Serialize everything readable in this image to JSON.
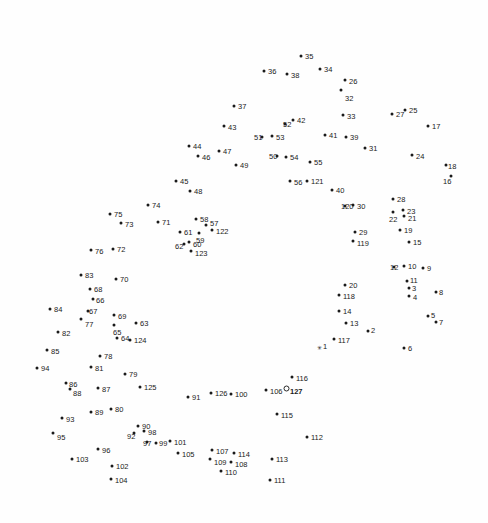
{
  "page": {
    "type": "connect-the-dots",
    "width": 488,
    "height": 523,
    "background_color": "#fefefe",
    "dot_color": "#1a1a1a",
    "label_color": "#1a1a1a",
    "total_dots": 127,
    "start_label": "127",
    "start_marker": "open-circle",
    "first_point_marker": "asterisk"
  },
  "dots": [
    {
      "n": "1",
      "x": 319,
      "y": 347,
      "lx": 323,
      "ly": 343,
      "marker": "star"
    },
    {
      "n": "2",
      "x": 368,
      "y": 331,
      "lx": 371,
      "ly": 327,
      "marker": "dot"
    },
    {
      "n": "3",
      "x": 409,
      "y": 288,
      "lx": 412,
      "ly": 285,
      "marker": "dot"
    },
    {
      "n": "4",
      "x": 409,
      "y": 296,
      "lx": 413,
      "ly": 294,
      "marker": "dot"
    },
    {
      "n": "5",
      "x": 428,
      "y": 316,
      "lx": 431,
      "ly": 312,
      "marker": "dot"
    },
    {
      "n": "6",
      "x": 404,
      "y": 348,
      "lx": 408,
      "ly": 345,
      "marker": "dot"
    },
    {
      "n": "7",
      "x": 436,
      "y": 322,
      "lx": 439,
      "ly": 319,
      "marker": "dot"
    },
    {
      "n": "8",
      "x": 436,
      "y": 292,
      "lx": 439,
      "ly": 289,
      "marker": "dot"
    },
    {
      "n": "9",
      "x": 423,
      "y": 268,
      "lx": 427,
      "ly": 265,
      "marker": "dot"
    },
    {
      "n": "10",
      "x": 404,
      "y": 266,
      "lx": 408,
      "ly": 263,
      "marker": "dot"
    },
    {
      "n": "11",
      "x": 407,
      "y": 281,
      "lx": 410,
      "ly": 277,
      "marker": "dot"
    },
    {
      "n": "12",
      "x": 394,
      "y": 267,
      "lx": 390,
      "ly": 264,
      "marker": "dot"
    },
    {
      "n": "13",
      "x": 346,
      "y": 323,
      "lx": 350,
      "ly": 320,
      "marker": "dot"
    },
    {
      "n": "14",
      "x": 339,
      "y": 311,
      "lx": 343,
      "ly": 308,
      "marker": "dot"
    },
    {
      "n": "15",
      "x": 409,
      "y": 242,
      "lx": 413,
      "ly": 239,
      "marker": "dot"
    },
    {
      "n": "16",
      "x": 451,
      "y": 176,
      "lx": 443,
      "ly": 178,
      "marker": "dot"
    },
    {
      "n": "17",
      "x": 428,
      "y": 126,
      "lx": 432,
      "ly": 123,
      "marker": "dot"
    },
    {
      "n": "18",
      "x": 446,
      "y": 165,
      "lx": 448,
      "ly": 163,
      "marker": "dot"
    },
    {
      "n": "19",
      "x": 400,
      "y": 230,
      "lx": 404,
      "ly": 227,
      "marker": "dot"
    },
    {
      "n": "20",
      "x": 345,
      "y": 285,
      "lx": 349,
      "ly": 282,
      "marker": "dot"
    },
    {
      "n": "21",
      "x": 404,
      "y": 216,
      "lx": 408,
      "ly": 215,
      "marker": "dot"
    },
    {
      "n": "22",
      "x": 393,
      "y": 212,
      "lx": 389,
      "ly": 216,
      "marker": "dot"
    },
    {
      "n": "23",
      "x": 403,
      "y": 210,
      "lx": 407,
      "ly": 208,
      "marker": "dot"
    },
    {
      "n": "24",
      "x": 412,
      "y": 155,
      "lx": 416,
      "ly": 153,
      "marker": "dot"
    },
    {
      "n": "25",
      "x": 405,
      "y": 110,
      "lx": 409,
      "ly": 107,
      "marker": "dot"
    },
    {
      "n": "26",
      "x": 345,
      "y": 80,
      "lx": 349,
      "ly": 78,
      "marker": "dot"
    },
    {
      "n": "27",
      "x": 392,
      "y": 114,
      "lx": 396,
      "ly": 111,
      "marker": "dot"
    },
    {
      "n": "28",
      "x": 393,
      "y": 199,
      "lx": 397,
      "ly": 196,
      "marker": "dot"
    },
    {
      "n": "29",
      "x": 355,
      "y": 232,
      "lx": 359,
      "ly": 229,
      "marker": "dot"
    },
    {
      "n": "30",
      "x": 353,
      "y": 205,
      "lx": 357,
      "ly": 203,
      "marker": "dot"
    },
    {
      "n": "31",
      "x": 365,
      "y": 148,
      "lx": 369,
      "ly": 145,
      "marker": "dot"
    },
    {
      "n": "32",
      "x": 341,
      "y": 90,
      "lx": 345,
      "ly": 95,
      "marker": "dot"
    },
    {
      "n": "33",
      "x": 343,
      "y": 115,
      "lx": 347,
      "ly": 113,
      "marker": "dot"
    },
    {
      "n": "34",
      "x": 320,
      "y": 69,
      "lx": 324,
      "ly": 66,
      "marker": "dot"
    },
    {
      "n": "35",
      "x": 301,
      "y": 56,
      "lx": 305,
      "ly": 53,
      "marker": "dot"
    },
    {
      "n": "36",
      "x": 264,
      "y": 71,
      "lx": 268,
      "ly": 68,
      "marker": "dot"
    },
    {
      "n": "37",
      "x": 234,
      "y": 106,
      "lx": 238,
      "ly": 103,
      "marker": "dot"
    },
    {
      "n": "38",
      "x": 287,
      "y": 74,
      "lx": 291,
      "ly": 72,
      "marker": "dot"
    },
    {
      "n": "39",
      "x": 346,
      "y": 137,
      "lx": 350,
      "ly": 134,
      "marker": "dot"
    },
    {
      "n": "40",
      "x": 332,
      "y": 190,
      "lx": 336,
      "ly": 187,
      "marker": "dot"
    },
    {
      "n": "41",
      "x": 325,
      "y": 135,
      "lx": 329,
      "ly": 132,
      "marker": "dot"
    },
    {
      "n": "42",
      "x": 293,
      "y": 120,
      "lx": 297,
      "ly": 117,
      "marker": "dot"
    },
    {
      "n": "43",
      "x": 224,
      "y": 126,
      "lx": 228,
      "ly": 124,
      "marker": "dot"
    },
    {
      "n": "44",
      "x": 189,
      "y": 146,
      "lx": 193,
      "ly": 143,
      "marker": "dot"
    },
    {
      "n": "45",
      "x": 176,
      "y": 181,
      "lx": 180,
      "ly": 178,
      "marker": "dot"
    },
    {
      "n": "46",
      "x": 198,
      "y": 156,
      "lx": 202,
      "ly": 154,
      "marker": "dot"
    },
    {
      "n": "47",
      "x": 219,
      "y": 151,
      "lx": 223,
      "ly": 148,
      "marker": "dot"
    },
    {
      "n": "48",
      "x": 190,
      "y": 191,
      "lx": 194,
      "ly": 188,
      "marker": "dot"
    },
    {
      "n": "49",
      "x": 236,
      "y": 165,
      "lx": 240,
      "ly": 162,
      "marker": "dot"
    },
    {
      "n": "50",
      "x": 277,
      "y": 156,
      "lx": 269,
      "ly": 153,
      "marker": "dot"
    },
    {
      "n": "51",
      "x": 262,
      "y": 137,
      "lx": 254,
      "ly": 134,
      "marker": "dot"
    },
    {
      "n": "52",
      "x": 285,
      "y": 124,
      "lx": 283,
      "ly": 121,
      "marker": "dot"
    },
    {
      "n": "53",
      "x": 272,
      "y": 136,
      "lx": 276,
      "ly": 134,
      "marker": "dot"
    },
    {
      "n": "54",
      "x": 286,
      "y": 157,
      "lx": 290,
      "ly": 154,
      "marker": "dot"
    },
    {
      "n": "55",
      "x": 310,
      "y": 162,
      "lx": 314,
      "ly": 159,
      "marker": "dot"
    },
    {
      "n": "56",
      "x": 290,
      "y": 181,
      "lx": 294,
      "ly": 179,
      "marker": "dot"
    },
    {
      "n": "57",
      "x": 206,
      "y": 225,
      "lx": 210,
      "ly": 220,
      "marker": "dot"
    },
    {
      "n": "58",
      "x": 196,
      "y": 219,
      "lx": 200,
      "ly": 216,
      "marker": "dot"
    },
    {
      "n": "59",
      "x": 199,
      "y": 233,
      "lx": 196,
      "ly": 237,
      "marker": "dot"
    },
    {
      "n": "60",
      "x": 189,
      "y": 242,
      "lx": 193,
      "ly": 241,
      "marker": "dot"
    },
    {
      "n": "61",
      "x": 180,
      "y": 232,
      "lx": 184,
      "ly": 229,
      "marker": "dot"
    },
    {
      "n": "62",
      "x": 184,
      "y": 244,
      "lx": 175,
      "ly": 243,
      "marker": "dot"
    },
    {
      "n": "63",
      "x": 136,
      "y": 323,
      "lx": 140,
      "ly": 320,
      "marker": "dot"
    },
    {
      "n": "64",
      "x": 117,
      "y": 338,
      "lx": 121,
      "ly": 335,
      "marker": "dot"
    },
    {
      "n": "65",
      "x": 114,
      "y": 325,
      "lx": 113,
      "ly": 329,
      "marker": "dot"
    },
    {
      "n": "66",
      "x": 93,
      "y": 299,
      "lx": 96,
      "ly": 297,
      "marker": "dot"
    },
    {
      "n": "67",
      "x": 88,
      "y": 311,
      "lx": 89,
      "ly": 308,
      "marker": "dot"
    },
    {
      "n": "68",
      "x": 90,
      "y": 289,
      "lx": 94,
      "ly": 286,
      "marker": "dot"
    },
    {
      "n": "69",
      "x": 114,
      "y": 315,
      "lx": 118,
      "ly": 313,
      "marker": "dot"
    },
    {
      "n": "70",
      "x": 116,
      "y": 279,
      "lx": 120,
      "ly": 276,
      "marker": "dot"
    },
    {
      "n": "71",
      "x": 158,
      "y": 222,
      "lx": 162,
      "ly": 219,
      "marker": "dot"
    },
    {
      "n": "72",
      "x": 113,
      "y": 249,
      "lx": 117,
      "ly": 246,
      "marker": "dot"
    },
    {
      "n": "73",
      "x": 121,
      "y": 223,
      "lx": 125,
      "ly": 221,
      "marker": "dot"
    },
    {
      "n": "74",
      "x": 148,
      "y": 205,
      "lx": 152,
      "ly": 202,
      "marker": "dot"
    },
    {
      "n": "75",
      "x": 110,
      "y": 214,
      "lx": 114,
      "ly": 211,
      "marker": "dot"
    },
    {
      "n": "76",
      "x": 91,
      "y": 250,
      "lx": 95,
      "ly": 248,
      "marker": "dot"
    },
    {
      "n": "77",
      "x": 81,
      "y": 319,
      "lx": 85,
      "ly": 321,
      "marker": "dot"
    },
    {
      "n": "78",
      "x": 100,
      "y": 356,
      "lx": 104,
      "ly": 353,
      "marker": "dot"
    },
    {
      "n": "79",
      "x": 125,
      "y": 374,
      "lx": 129,
      "ly": 371,
      "marker": "dot"
    },
    {
      "n": "80",
      "x": 111,
      "y": 409,
      "lx": 115,
      "ly": 406,
      "marker": "dot"
    },
    {
      "n": "81",
      "x": 91,
      "y": 367,
      "lx": 95,
      "ly": 365,
      "marker": "dot"
    },
    {
      "n": "82",
      "x": 58,
      "y": 332,
      "lx": 62,
      "ly": 330,
      "marker": "dot"
    },
    {
      "n": "83",
      "x": 81,
      "y": 275,
      "lx": 85,
      "ly": 272,
      "marker": "dot"
    },
    {
      "n": "84",
      "x": 50,
      "y": 309,
      "lx": 54,
      "ly": 306,
      "marker": "dot"
    },
    {
      "n": "85",
      "x": 47,
      "y": 350,
      "lx": 51,
      "ly": 348,
      "marker": "dot"
    },
    {
      "n": "86",
      "x": 66,
      "y": 383,
      "lx": 69,
      "ly": 381,
      "marker": "dot"
    },
    {
      "n": "87",
      "x": 98,
      "y": 388,
      "lx": 102,
      "ly": 386,
      "marker": "dot"
    },
    {
      "n": "88",
      "x": 70,
      "y": 389,
      "lx": 73,
      "ly": 390,
      "marker": "dot"
    },
    {
      "n": "89",
      "x": 91,
      "y": 412,
      "lx": 95,
      "ly": 409,
      "marker": "dot"
    },
    {
      "n": "90",
      "x": 138,
      "y": 426,
      "lx": 142,
      "ly": 423,
      "marker": "dot"
    },
    {
      "n": "91",
      "x": 188,
      "y": 397,
      "lx": 192,
      "ly": 394,
      "marker": "dot"
    },
    {
      "n": "92",
      "x": 134,
      "y": 433,
      "lx": 127,
      "ly": 433,
      "marker": "dot"
    },
    {
      "n": "93",
      "x": 62,
      "y": 418,
      "lx": 66,
      "ly": 416,
      "marker": "dot"
    },
    {
      "n": "94",
      "x": 37,
      "y": 368,
      "lx": 41,
      "ly": 365,
      "marker": "dot"
    },
    {
      "n": "95",
      "x": 53,
      "y": 433,
      "lx": 57,
      "ly": 434,
      "marker": "dot"
    },
    {
      "n": "96",
      "x": 98,
      "y": 449,
      "lx": 102,
      "ly": 447,
      "marker": "dot"
    },
    {
      "n": "97",
      "x": 147,
      "y": 442,
      "lx": 143,
      "ly": 440,
      "marker": "dot"
    },
    {
      "n": "98",
      "x": 144,
      "y": 431,
      "lx": 148,
      "ly": 429,
      "marker": "dot"
    },
    {
      "n": "99",
      "x": 156,
      "y": 443,
      "lx": 159,
      "ly": 440,
      "marker": "dot"
    },
    {
      "n": "100",
      "x": 231,
      "y": 394,
      "lx": 235,
      "ly": 391,
      "marker": "dot"
    },
    {
      "n": "101",
      "x": 170,
      "y": 441,
      "lx": 174,
      "ly": 439,
      "marker": "dot"
    },
    {
      "n": "102",
      "x": 112,
      "y": 466,
      "lx": 116,
      "ly": 463,
      "marker": "dot"
    },
    {
      "n": "103",
      "x": 72,
      "y": 459,
      "lx": 76,
      "ly": 456,
      "marker": "dot"
    },
    {
      "n": "104",
      "x": 111,
      "y": 479,
      "lx": 115,
      "ly": 477,
      "marker": "dot"
    },
    {
      "n": "105",
      "x": 178,
      "y": 453,
      "lx": 182,
      "ly": 451,
      "marker": "dot"
    },
    {
      "n": "106",
      "x": 266,
      "y": 390,
      "lx": 270,
      "ly": 388,
      "marker": "dot"
    },
    {
      "n": "107",
      "x": 212,
      "y": 450,
      "lx": 216,
      "ly": 448,
      "marker": "dot"
    },
    {
      "n": "108",
      "x": 231,
      "y": 462,
      "lx": 235,
      "ly": 461,
      "marker": "dot"
    },
    {
      "n": "109",
      "x": 210,
      "y": 459,
      "lx": 214,
      "ly": 459,
      "marker": "dot"
    },
    {
      "n": "110",
      "x": 221,
      "y": 471,
      "lx": 225,
      "ly": 469,
      "marker": "dot"
    },
    {
      "n": "111",
      "x": 270,
      "y": 480,
      "lx": 274,
      "ly": 477,
      "marker": "dot"
    },
    {
      "n": "112",
      "x": 307,
      "y": 437,
      "lx": 311,
      "ly": 434,
      "marker": "dot"
    },
    {
      "n": "113",
      "x": 272,
      "y": 459,
      "lx": 276,
      "ly": 456,
      "marker": "dot"
    },
    {
      "n": "114",
      "x": 234,
      "y": 453,
      "lx": 238,
      "ly": 451,
      "marker": "dot"
    },
    {
      "n": "115",
      "x": 277,
      "y": 414,
      "lx": 281,
      "ly": 412,
      "marker": "dot"
    },
    {
      "n": "116",
      "x": 292,
      "y": 377,
      "lx": 296,
      "ly": 375,
      "marker": "dot"
    },
    {
      "n": "117",
      "x": 334,
      "y": 339,
      "lx": 338,
      "ly": 337,
      "marker": "dot"
    },
    {
      "n": "118",
      "x": 339,
      "y": 295,
      "lx": 343,
      "ly": 293,
      "marker": "dot"
    },
    {
      "n": "119",
      "x": 353,
      "y": 241,
      "lx": 357,
      "ly": 240,
      "marker": "dot"
    },
    {
      "n": "120",
      "x": 345,
      "y": 206,
      "lx": 341,
      "ly": 203,
      "marker": "dot"
    },
    {
      "n": "121",
      "x": 307,
      "y": 181,
      "lx": 311,
      "ly": 178,
      "marker": "dot"
    },
    {
      "n": "122",
      "x": 212,
      "y": 230,
      "lx": 216,
      "ly": 228,
      "marker": "dot"
    },
    {
      "n": "123",
      "x": 191,
      "y": 251,
      "lx": 195,
      "ly": 250,
      "marker": "dot"
    },
    {
      "n": "124",
      "x": 130,
      "y": 340,
      "lx": 134,
      "ly": 337,
      "marker": "dot"
    },
    {
      "n": "125",
      "x": 140,
      "y": 387,
      "lx": 144,
      "ly": 384,
      "marker": "dot"
    },
    {
      "n": "126",
      "x": 211,
      "y": 393,
      "lx": 215,
      "ly": 390,
      "marker": "dot"
    },
    {
      "n": "127",
      "x": 286,
      "y": 388,
      "lx": 290,
      "ly": 388,
      "marker": "start"
    }
  ]
}
